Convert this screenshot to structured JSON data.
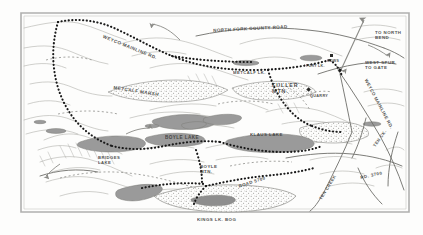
{
  "map": {
    "title": "North Fork County Road logging map",
    "frame": {
      "color": "#b0b0ae",
      "x": 20,
      "y": 12,
      "w": 390,
      "h": 200
    },
    "colors": {
      "paper": "#fdfdfc",
      "ink": "#3a3a38",
      "contour": "#a8a8a4",
      "water": "#9a9a9a",
      "marsh_outline": "#8c8c88",
      "road_line": "#6e6e6a",
      "trail_dots": "#1a1a1a"
    },
    "labels": [
      {
        "name": "weyco-mainline-rd-west",
        "text": "WEYCO MAINLINE RD.",
        "x": 104,
        "y": 34,
        "rot": 22,
        "size": 4.6
      },
      {
        "name": "north-fork-county-road",
        "text": "NORTH FORK COUNTY ROAD",
        "x": 213,
        "y": 28,
        "rot": -3,
        "size": 4.5
      },
      {
        "name": "to-north-bend",
        "text": "TO NORTH\nBEND",
        "x": 375,
        "y": 30,
        "rot": 0,
        "size": 4.4
      },
      {
        "name": "west-spur-to-gate",
        "text": "WEST SPUR\nTO GATE",
        "x": 365,
        "y": 60,
        "rot": 0,
        "size": 4.4
      },
      {
        "name": "weyco-mainline-rd-east",
        "text": "WEYCO MAINLINE RD.",
        "x": 368,
        "y": 78,
        "rot": 62,
        "size": 4.4
      },
      {
        "name": "metcalf-lk",
        "text": "METCALF LK.",
        "x": 233,
        "y": 70,
        "rot": 0,
        "size": 4.2
      },
      {
        "name": "metcalf-marsh",
        "text": "METCALF MARSH",
        "x": 114,
        "y": 85,
        "rot": 9,
        "size": 4.6
      },
      {
        "name": "fury-lk",
        "text": "FURY LK.",
        "x": 306,
        "y": 64,
        "rot": 0,
        "size": 3.6
      },
      {
        "name": "hdws",
        "text": "HDWS",
        "x": 327,
        "y": 59,
        "rot": 0,
        "size": 3.6
      },
      {
        "name": "fuller-mtn",
        "text": "FULLER\nMTN.",
        "x": 272,
        "y": 82,
        "rot": 0,
        "size": 5.4
      },
      {
        "name": "quarry",
        "text": "QUARRY",
        "x": 310,
        "y": 94,
        "rot": 0,
        "size": 3.8
      },
      {
        "name": "klaus-lake",
        "text": "KLAUS LAKE",
        "x": 250,
        "y": 132,
        "rot": 0,
        "size": 4.4
      },
      {
        "name": "boyle-lake",
        "text": "BOYLE LAKE",
        "x": 165,
        "y": 135,
        "rot": 0,
        "size": 4.6
      },
      {
        "name": "bridges-lake",
        "text": "BRIDGES\nLAKE",
        "x": 98,
        "y": 155,
        "rot": 0,
        "size": 4.2
      },
      {
        "name": "boyle-mtn",
        "text": "BOYLE\nMTN.",
        "x": 200,
        "y": 164,
        "rot": 0,
        "size": 4.4
      },
      {
        "name": "ten-ck",
        "text": "TEN CK.",
        "x": 372,
        "y": 145,
        "rot": -55,
        "size": 4.2
      },
      {
        "name": "rd-3700",
        "text": "RD. 3700",
        "x": 360,
        "y": 175,
        "rot": -12,
        "size": 4.4
      },
      {
        "name": "ten-creek",
        "text": "TEN CREEK",
        "x": 318,
        "y": 198,
        "rot": -58,
        "size": 4.2
      },
      {
        "name": "road-5700",
        "text": "ROAD 5700",
        "x": 238,
        "y": 184,
        "rot": -18,
        "size": 4.4
      },
      {
        "name": "kings-lk-bog",
        "text": "KINGS LK. BOG",
        "x": 197,
        "y": 217,
        "rot": 0,
        "size": 4.4
      }
    ],
    "water_bodies": [
      {
        "name": "metcalf-lk",
        "label": "METCALF LK."
      },
      {
        "name": "fury-lk",
        "label": "FURY LK."
      },
      {
        "name": "klaus-lake",
        "label": "KLAUS LAKE"
      },
      {
        "name": "boyle-lake",
        "label": "BOYLE LAKE"
      },
      {
        "name": "bridges-lake",
        "label": "BRIDGES LAKE"
      },
      {
        "name": "kings-lk-bog",
        "label": "KINGS LK. BOG"
      }
    ],
    "roads": [
      {
        "name": "weyco-mainline-rd",
        "label": "WEYCO MAINLINE RD.",
        "style": "dotted"
      },
      {
        "name": "north-fork-county-road",
        "label": "NORTH FORK COUNTY ROAD",
        "style": "solid"
      },
      {
        "name": "west-spur-to-gate",
        "label": "WEST SPUR TO GATE",
        "style": "solid"
      },
      {
        "name": "road-5700",
        "label": "ROAD 5700",
        "style": "dotted"
      },
      {
        "name": "rd-3700",
        "label": "RD. 3700",
        "style": "dashed"
      }
    ],
    "peaks": [
      {
        "name": "fuller-mtn",
        "label": "FULLER MTN."
      },
      {
        "name": "boyle-mtn",
        "label": "BOYLE MTN."
      }
    ],
    "sites": [
      {
        "name": "quarry",
        "label": "QUARRY"
      },
      {
        "name": "hdws",
        "label": "HDWS"
      }
    ],
    "directions": [
      {
        "name": "to-north-bend",
        "label": "TO NORTH BEND"
      }
    ]
  }
}
